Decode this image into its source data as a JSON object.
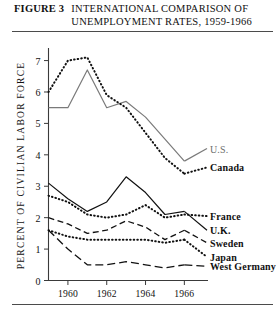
{
  "figure": {
    "number": "FIGURE 3",
    "title_line1": "INTERNATIONAL COMPARISON OF",
    "title_line2": "UNEMPLOYMENT RATES, 1959-1966"
  },
  "chart_data": {
    "type": "line",
    "title": "INTERNATIONAL COMPARISON OF UNEMPLOYMENT RATES, 1959-1966",
    "xlabel": "",
    "ylabel": "PERCENT OF CIVILIAN LABOR FORCE",
    "x": [
      1959,
      1960,
      1961,
      1962,
      1963,
      1964,
      1965,
      1966
    ],
    "xlim": [
      1959,
      1966.6
    ],
    "ylim": [
      0,
      7.4
    ],
    "yticks": [
      0,
      1,
      2,
      3,
      4,
      5,
      6,
      7
    ],
    "ytick_labels": [
      "0",
      "1",
      "2",
      "3",
      "4",
      "5",
      "6",
      "7"
    ],
    "xticks": [
      1960,
      1962,
      1964,
      1966
    ],
    "xtick_labels": [
      "1960",
      "1962",
      "1964",
      "1966"
    ],
    "grid": false,
    "legend": "inline-right",
    "series": [
      {
        "name": "U.S.",
        "style": "solid",
        "color": "#7a7a7a",
        "label_value": 4.2,
        "values": [
          5.5,
          5.5,
          6.7,
          5.5,
          5.7,
          5.2,
          4.5,
          3.8
        ]
      },
      {
        "name": "Canada",
        "style": "dotted",
        "color": "#111111",
        "label_value": 3.6,
        "values": [
          6.0,
          7.0,
          7.1,
          5.9,
          5.5,
          4.7,
          3.9,
          3.4
        ]
      },
      {
        "name": "France",
        "style": "dotted",
        "color": "#111111",
        "label_value": 2.05,
        "values": [
          2.7,
          2.5,
          2.1,
          2.0,
          2.1,
          2.4,
          2.0,
          2.1
        ]
      },
      {
        "name": "U.K.",
        "style": "solid",
        "color": "#111111",
        "label_value": 1.6,
        "values": [
          3.1,
          2.6,
          2.2,
          2.5,
          3.3,
          2.8,
          2.1,
          2.2
        ]
      },
      {
        "name": "Sweden",
        "style": "dashed",
        "color": "#111111",
        "label_value": 1.2,
        "values": [
          2.0,
          1.8,
          1.5,
          1.6,
          1.9,
          1.7,
          1.3,
          1.6
        ]
      },
      {
        "name": "Japan",
        "style": "dotted",
        "color": "#111111",
        "label_value": 0.75,
        "values": [
          1.6,
          1.4,
          1.3,
          1.3,
          1.3,
          1.3,
          1.2,
          1.3
        ]
      },
      {
        "name": "West Germany",
        "style": "long-dash",
        "color": "#111111",
        "label_value": 0.45,
        "values": [
          1.6,
          1.0,
          0.5,
          0.5,
          0.6,
          0.5,
          0.4,
          0.5
        ]
      }
    ]
  }
}
